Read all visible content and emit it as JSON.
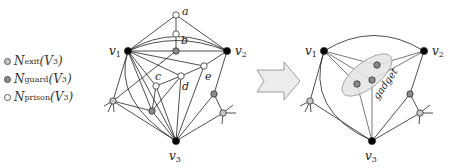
{
  "legend": {
    "items": [
      {
        "name": "N",
        "sub": "exit",
        "arg": "(V",
        "argsub": "3",
        "close": ")",
        "color": "#c8c8c8"
      },
      {
        "name": "N",
        "sub": "guard",
        "arg": "(V",
        "argsub": "3",
        "close": ")",
        "color": "#8a8a8a"
      },
      {
        "name": "N",
        "sub": "prison",
        "arg": "(V",
        "argsub": "3",
        "close": ")",
        "color": "#ffffff"
      }
    ]
  },
  "left_graph": {
    "labels": {
      "v1": "v",
      "v1_sub": "1",
      "v2": "v",
      "v2_sub": "2",
      "v3": "v",
      "v3_sub": "3",
      "a": "a",
      "b": "b",
      "c": "c",
      "d": "d",
      "e": "e"
    }
  },
  "right_graph": {
    "labels": {
      "v1": "v",
      "v1_sub": "1",
      "v2": "v",
      "v2_sub": "2",
      "v3": "v",
      "v3_sub": "3",
      "gadget": "gadget"
    }
  },
  "colors": {
    "terminal": "#000000",
    "exit": "#c8c8c8",
    "guard": "#8a8a8a",
    "prison": "#ffffff",
    "gadget_fill": "#e4e4e4",
    "arrow_fill": "#ececec"
  }
}
